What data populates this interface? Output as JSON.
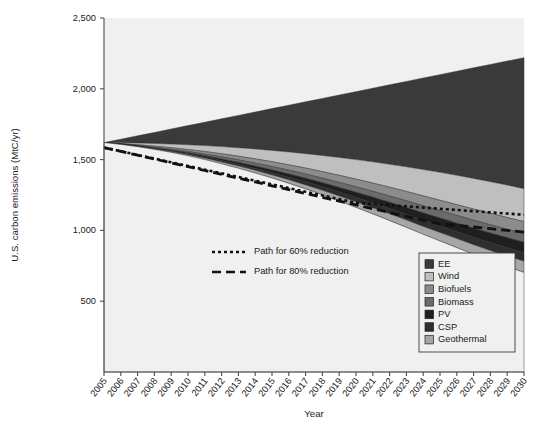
{
  "chart_data": {
    "type": "area",
    "title": "",
    "xlabel": "Year",
    "ylabel": "U.S. carbon emissions (MtC/yr)",
    "xlim": [
      2005,
      2030
    ],
    "ylim": [
      0,
      2500
    ],
    "ytick_labels": [
      "500",
      "1,000",
      "1,500",
      "2,000",
      "2,500"
    ],
    "ytick_values": [
      500,
      1000,
      1500,
      2000,
      2500
    ],
    "x": [
      2005,
      2006,
      2007,
      2008,
      2009,
      2010,
      2011,
      2012,
      2013,
      2014,
      2015,
      2016,
      2017,
      2018,
      2019,
      2020,
      2021,
      2022,
      2023,
      2024,
      2025,
      2026,
      2027,
      2028,
      2029,
      2030
    ],
    "xtick_labels": [
      "2005",
      "2006",
      "2007",
      "2008",
      "2009",
      "2010",
      "2011",
      "2012",
      "2013",
      "2014",
      "2015",
      "2016",
      "2017",
      "2018",
      "2019",
      "2020",
      "2021",
      "2022",
      "2023",
      "2024",
      "2025",
      "2026",
      "2027",
      "2028",
      "2029",
      "2030"
    ],
    "grid": false,
    "legend_position": "bottom-right",
    "stack_order": "top-to-bottom",
    "baseline_reference": {
      "name": "Business-as-usual emissions",
      "values": [
        1620,
        1644,
        1668,
        1692,
        1716,
        1740,
        1764,
        1788,
        1812,
        1836,
        1860,
        1884,
        1908,
        1932,
        1956,
        1980,
        2004,
        2028,
        2052,
        2076,
        2100,
        2124,
        2148,
        2172,
        2196,
        2220
      ]
    },
    "series": [
      {
        "name": "EE",
        "color": "#3a3a3a",
        "values": [
          0,
          25,
          51,
          78,
          106,
          135,
          165,
          196,
          228,
          261,
          295,
          330,
          366,
          403,
          441,
          480,
          520,
          561,
          603,
          646,
          690,
          735,
          781,
          828,
          876,
          925
        ]
      },
      {
        "name": "Wind",
        "color": "#bfbfbf",
        "values": [
          0,
          6,
          12,
          19,
          26,
          34,
          42,
          51,
          60,
          70,
          80,
          91,
          102,
          114,
          126,
          138,
          150,
          162,
          174,
          186,
          197,
          207,
          216,
          223,
          229,
          233
        ]
      },
      {
        "name": "Biofuels",
        "color": "#8c8c8c",
        "values": [
          0,
          2,
          5,
          8,
          11,
          14,
          18,
          22,
          26,
          30,
          34,
          38,
          42,
          46,
          50,
          54,
          58,
          62,
          66,
          70,
          73,
          76,
          79,
          81,
          83,
          85
        ]
      },
      {
        "name": "Biomass",
        "color": "#6b6b6b",
        "values": [
          0,
          1,
          3,
          5,
          7,
          9,
          12,
          15,
          18,
          21,
          24,
          27,
          30,
          33,
          36,
          39,
          42,
          45,
          48,
          51,
          53,
          55,
          57,
          59,
          60,
          61
        ]
      },
      {
        "name": "PV",
        "color": "#1f1f1f",
        "values": [
          0,
          1,
          2,
          3,
          5,
          7,
          9,
          11,
          13,
          16,
          19,
          22,
          25,
          28,
          32,
          36,
          40,
          44,
          48,
          52,
          56,
          60,
          64,
          68,
          71,
          74
        ]
      },
      {
        "name": "CSP",
        "color": "#2e2e2e",
        "values": [
          0,
          1,
          2,
          3,
          4,
          6,
          8,
          10,
          12,
          14,
          16,
          19,
          22,
          25,
          28,
          31,
          34,
          37,
          40,
          43,
          46,
          49,
          52,
          55,
          57,
          59
        ]
      },
      {
        "name": "Geothermal",
        "color": "#a6a6a6",
        "values": [
          0,
          1,
          2,
          4,
          6,
          8,
          10,
          13,
          16,
          19,
          22,
          25,
          28,
          32,
          36,
          40,
          44,
          48,
          52,
          56,
          60,
          64,
          68,
          72,
          76,
          80
        ]
      }
    ],
    "reduction_paths": [
      {
        "name": "Path for 60% reduction",
        "label": "Path for 60% reduction",
        "dash": "3,3",
        "width": 2.6,
        "values": [
          1585,
          1559,
          1533,
          1507,
          1481,
          1455,
          1429,
          1403,
          1377,
          1351,
          1325,
          1299,
          1273,
          1247,
          1221,
          1195,
          1187,
          1178,
          1170,
          1161,
          1153,
          1144,
          1136,
          1127,
          1119,
          1110
        ]
      },
      {
        "name": "Path for 80% reduction",
        "label": "Path for 80% reduction",
        "dash": "9,5",
        "width": 2.8,
        "values": [
          1585,
          1558,
          1531,
          1504,
          1477,
          1450,
          1423,
          1396,
          1369,
          1342,
          1315,
          1288,
          1261,
          1234,
          1207,
          1180,
          1153,
          1126,
          1099,
          1072,
          1045,
          1035,
          1024,
          1012,
          1000,
          988
        ]
      }
    ]
  },
  "legend": {
    "items": [
      {
        "label": "EE",
        "color": "#3a3a3a"
      },
      {
        "label": "Wind",
        "color": "#bfbfbf"
      },
      {
        "label": "Biofuels",
        "color": "#8c8c8c"
      },
      {
        "label": "Biomass",
        "color": "#6b6b6b"
      },
      {
        "label": "PV",
        "color": "#1f1f1f"
      },
      {
        "label": "CSP",
        "color": "#2e2e2e"
      },
      {
        "label": "Geothermal",
        "color": "#a6a6a6"
      }
    ]
  },
  "path_legend": {
    "items": [
      {
        "label": "Path for 60% reduction",
        "dash": "3,3"
      },
      {
        "label": "Path for 80% reduction",
        "dash": "9,5"
      }
    ]
  }
}
